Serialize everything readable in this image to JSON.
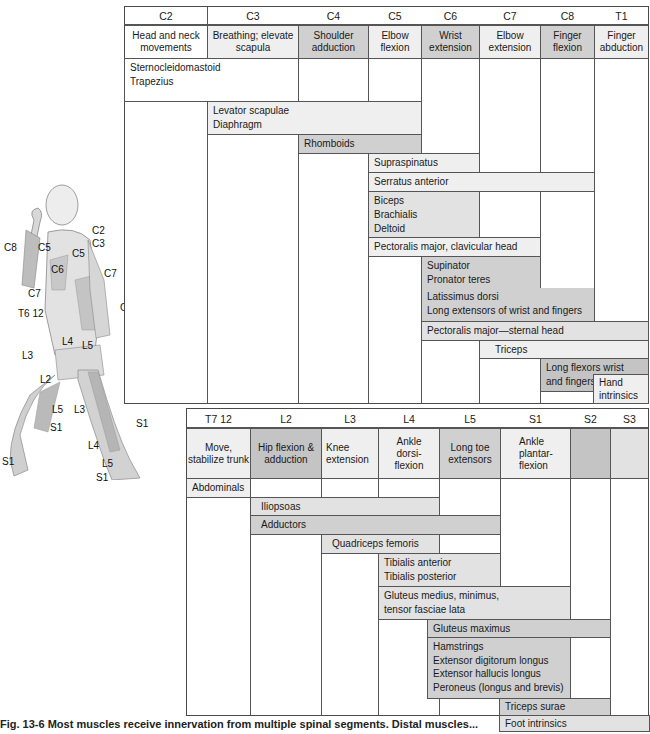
{
  "upper_table": {
    "segments": [
      "C2",
      "C3",
      "C4",
      "C5",
      "C6",
      "C7",
      "C8",
      "T1"
    ],
    "functions": [
      "Head and neck movements",
      "Breathing; elevate scapula",
      "Shoulder adduction",
      "Elbow flexion",
      "Wrist extension",
      "Elbow extension",
      "Finger flexion",
      "Finger abduction"
    ],
    "muscles": [
      {
        "label": "Sternocleidomastoid",
        "label2": "Trapezius",
        "from": "C2",
        "to": "C3"
      },
      {
        "label": "Levator scapulae",
        "label2": "Diaphragm",
        "from": "C3",
        "to": "C5"
      },
      {
        "label": "Rhomboids",
        "from": "C4",
        "to": "C5"
      },
      {
        "label": "Supraspinatus",
        "from": "C5",
        "to": "C6"
      },
      {
        "label": "Serratus anterior",
        "from": "C5",
        "to": "C8"
      },
      {
        "label": "Biceps",
        "label2": "Brachialis",
        "label3": "Deltoid",
        "from": "C5",
        "to": "C6"
      },
      {
        "label": "Pectoralis major, clavicular head",
        "from": "C5",
        "to": "C7"
      },
      {
        "label": "Supinator",
        "label2": "Pronator teres",
        "from": "C6",
        "to": "C7"
      },
      {
        "label": "Latissimus dorsi",
        "label2": "Long extensors of wrist and fingers",
        "from": "C6",
        "to": "C8"
      },
      {
        "label": "Pectoralis major—sternal head",
        "from": "C6",
        "to": "T1"
      },
      {
        "label": "Triceps",
        "from": "C7",
        "to": "T1"
      },
      {
        "label": "Long flexors wrist",
        "label2": "and fingers",
        "from": "C8",
        "to": "T1"
      },
      {
        "label": "Hand",
        "label2": "intrinsics",
        "from": "T1",
        "to": "T1"
      }
    ]
  },
  "lower_table": {
    "segments": [
      "T7 12",
      "L2",
      "L3",
      "L4",
      "L5",
      "S1",
      "S2",
      "S3"
    ],
    "functions": [
      "Move, stabilize trunk",
      "Hip flexion & adduction",
      "Knee extension",
      "Ankle dorsi- flexion",
      "Long toe extensors",
      "Ankle plantar- flexion",
      "",
      ""
    ],
    "muscles": [
      {
        "label": "Abdominals",
        "from": "T7 12",
        "to": "T7 12"
      },
      {
        "label": "Iliopsoas",
        "from": "L2",
        "to": "L4"
      },
      {
        "label": "Adductors",
        "from": "L2",
        "to": "L5"
      },
      {
        "label": "Quadriceps femoris",
        "from": "L3",
        "to": "L4"
      },
      {
        "label": "Tibialis anterior",
        "label2": "Tibialis posterior",
        "from": "L4",
        "to": "L5"
      },
      {
        "label": "Gluteus medius, minimus,",
        "label2": "tensor fasciae lata",
        "from": "L4",
        "to": "S1"
      },
      {
        "label": "Gluteus maximus",
        "from": "L5",
        "to": "S2"
      },
      {
        "label": "Hamstrings",
        "label2": "Extensor digitorum longus",
        "label3": "Extensor hallucis longus",
        "label4": "Peroneus (longus and brevis)",
        "from": "L5",
        "to": "S1"
      },
      {
        "label": "Triceps surae",
        "from": "S1",
        "to": "S2"
      },
      {
        "label": "Foot intrinsics",
        "from": "S1",
        "to": "S3"
      }
    ]
  },
  "figure_labels": {
    "c2": "C2",
    "c3": "C3",
    "c5a": "C5",
    "c5b": "C5",
    "c6a": "C6",
    "c6b": "C6",
    "c7a": "C7",
    "c7b": "C7",
    "c8": "C8",
    "t6": "T6 12",
    "l2": "L2",
    "l3a": "L3",
    "l3b": "L3",
    "l4a": "L4",
    "l4b": "L4",
    "l5a": "L5",
    "l5b": "L5",
    "l5c": "L5",
    "s1a": "S1",
    "s1b": "S1",
    "s1c": "S1",
    "s1d": "S1"
  },
  "caption": "Fig. 13-6  Most muscles receive innervation from multiple spinal segments. Distal muscles..."
}
